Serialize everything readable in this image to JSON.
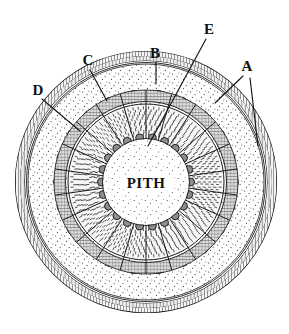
{
  "figure": {
    "kind": "labelled-botanical-cross-section",
    "background_color": "#ffffff",
    "ink_color": "#151515"
  },
  "center_label": {
    "text": "PITH",
    "x": 146,
    "y": 188
  },
  "callouts": [
    {
      "id": "A",
      "label": "A",
      "label_x": 247,
      "label_y": 71,
      "leaders": [
        {
          "x1": 243,
          "y1": 76,
          "x2": 215,
          "y2": 103
        },
        {
          "x1": 250,
          "y1": 78,
          "x2": 258,
          "y2": 146
        }
      ]
    },
    {
      "id": "B",
      "label": "B",
      "label_x": 155,
      "label_y": 58,
      "leaders": [
        {
          "x1": 156,
          "y1": 62,
          "x2": 156,
          "y2": 84
        }
      ]
    },
    {
      "id": "C",
      "label": "C",
      "label_x": 88,
      "label_y": 65,
      "leaders": [
        {
          "x1": 90,
          "y1": 70,
          "x2": 107,
          "y2": 101
        }
      ]
    },
    {
      "id": "D",
      "label": "D",
      "label_x": 38,
      "label_y": 95,
      "leaders": [
        {
          "x1": 42,
          "y1": 99,
          "x2": 80,
          "y2": 131
        }
      ]
    },
    {
      "id": "E",
      "label": "E",
      "label_x": 209,
      "label_y": 34,
      "leaders": [
        {
          "x1": 206,
          "y1": 39,
          "x2": 148,
          "y2": 146
        }
      ]
    }
  ],
  "geometry": {
    "center_x": 146,
    "center_y": 182,
    "ring_outer_1_r": 131,
    "ring_outer_2_r": 126,
    "ring_outer_3_r": 121,
    "cortex_outer_r": 118,
    "bundle_band_outer_r": 96,
    "bundle_band_inner_r": 84,
    "phloem_ring_r": 80,
    "xylem_outer_r": 78,
    "xylem_inner_r": 44,
    "pith_r": 42,
    "bundle_count": 22,
    "ray_count": 22
  },
  "layers": [
    {
      "name": "epidermis",
      "fill": "#ffffff",
      "stroke": "#151515"
    },
    {
      "name": "cortex",
      "fill": "#fbfbfb",
      "texture": "stipple"
    },
    {
      "name": "bundle-caps",
      "fill": "#9a9a9a",
      "texture": "hatch"
    },
    {
      "name": "phloem",
      "fill": "#d8d8d8",
      "texture": "fine-hatch"
    },
    {
      "name": "xylem",
      "fill": "#f2f2f2",
      "texture": "radial-dash"
    },
    {
      "name": "pith",
      "fill": "#ffffff",
      "texture": "stipple"
    }
  ]
}
